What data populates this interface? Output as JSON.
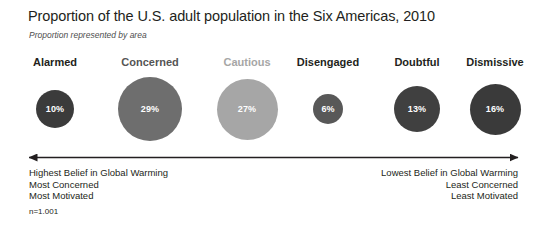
{
  "header": {
    "title": "Proportion of the U.S. adult population in the Six Americas, 2010",
    "subtitle": "Proportion represented by area"
  },
  "chart_data": {
    "type": "bar",
    "title": "Proportion of the U.S. adult population in the Six Americas, 2010",
    "subtitle": "Proportion represented by area",
    "xlabel": "",
    "ylabel": "",
    "units": "percent",
    "encoding": "area-proportional circles",
    "grid": false,
    "legend": false,
    "categories": [
      "Alarmed",
      "Concerned",
      "Cautious",
      "Disengaged",
      "Doubtful",
      "Dismissive"
    ],
    "values": [
      10,
      29,
      27,
      6,
      13,
      16
    ],
    "value_labels": [
      "10%",
      "29%",
      "27%",
      "6%",
      "13%",
      "16%"
    ],
    "colors": [
      "#3b3b3b",
      "#6e6e6e",
      "#a6a6a6",
      "#585858",
      "#404040",
      "#3a3a3a"
    ],
    "label_colors": [
      "#231f20",
      "#555555",
      "#a6a6a6",
      "#231f20",
      "#231f20",
      "#231f20"
    ],
    "diameters_px": [
      38,
      64,
      61,
      30,
      46,
      51
    ],
    "centers_x_px": [
      55,
      150,
      247,
      328,
      417,
      495
    ],
    "sample_size_note": "n=1.001"
  },
  "categories": [
    {
      "label": "Alarmed",
      "value": "10%",
      "color": "#3b3b3b",
      "label_color": "#231f20",
      "diameter": 38,
      "center": 55
    },
    {
      "label": "Concerned",
      "value": "29%",
      "color": "#6e6e6e",
      "label_color": "#555555",
      "diameter": 64,
      "center": 150
    },
    {
      "label": "Cautious",
      "value": "27%",
      "color": "#a6a6a6",
      "label_color": "#a6a6a6",
      "diameter": 61,
      "center": 247
    },
    {
      "label": "Disengaged",
      "value": "6%",
      "color": "#585858",
      "label_color": "#231f20",
      "diameter": 30,
      "center": 328
    },
    {
      "label": "Doubtful",
      "value": "13%",
      "color": "#404040",
      "label_color": "#231f20",
      "diameter": 46,
      "center": 417
    },
    {
      "label": "Dismissive",
      "value": "16%",
      "color": "#3a3a3a",
      "label_color": "#231f20",
      "diameter": 51,
      "center": 495
    }
  ],
  "spectrum": {
    "arrow_color": "#231f20",
    "left_note": {
      "line1": "Highest Belief in Global Warming",
      "line2": "Most Concerned",
      "line3": "Most Motivated"
    },
    "right_note": {
      "line1": "Lowest Belief in Global Warming",
      "line2": "Least Concerned",
      "line3": "Least Motivated"
    }
  },
  "footnote": {
    "text": "n=1.001"
  }
}
